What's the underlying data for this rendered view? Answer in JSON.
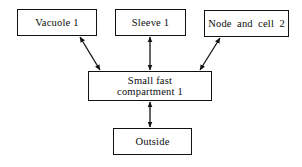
{
  "diagram": {
    "type": "flow-diagram",
    "background_color": "#ffffff",
    "line_color": "#111111",
    "text_color": "#0c0c0c",
    "nodes": [
      {
        "id": "vacuole",
        "label": "Vacuole  1",
        "shape": "rectangle"
      },
      {
        "id": "sleeve",
        "label": "Sleeve  1",
        "shape": "rectangle"
      },
      {
        "id": "node_cell",
        "label": "Node and  cell  2",
        "shape": "rectangle"
      },
      {
        "id": "small_fast",
        "label": "Small fast\ncompartment 1",
        "shape": "rectangle"
      },
      {
        "id": "outside",
        "label": "Outside",
        "shape": "rectangle"
      }
    ],
    "edges": [
      {
        "from": "small_fast",
        "to": "vacuole",
        "style": "double-headed-arrow",
        "orientation": "diagonal"
      },
      {
        "from": "small_fast",
        "to": "sleeve",
        "style": "double-headed-arrow",
        "orientation": "vertical"
      },
      {
        "from": "small_fast",
        "to": "node_cell",
        "style": "double-headed-arrow",
        "orientation": "diagonal"
      },
      {
        "from": "small_fast",
        "to": "outside",
        "style": "double-headed-arrow",
        "orientation": "vertical"
      }
    ]
  }
}
